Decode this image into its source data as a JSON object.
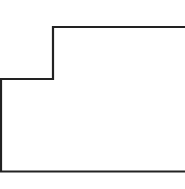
{
  "diagram": {
    "shape": "stepped-outline",
    "stroke_color": "#222222",
    "background": "#ffffff",
    "points": "1,185 1,79 53,79 53,27 186,27",
    "bottom_line": "1,171 186,171"
  }
}
